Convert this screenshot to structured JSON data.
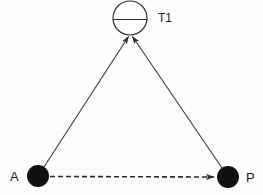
{
  "diagram": {
    "canvas": {
      "width": 263,
      "height": 195
    },
    "background_color": "#fdfdfd",
    "line_color": "#3a3a3a",
    "node_color": "#101010",
    "nodes": [
      {
        "id": "T1",
        "label": "T1",
        "type": "instrument-station",
        "symbol": "circle-with-horizontal-line",
        "x": 130,
        "y": 18,
        "radius": 17,
        "label_x": 158,
        "label_y": 22
      },
      {
        "id": "A",
        "label": "A",
        "type": "point-station",
        "symbol": "filled-circle",
        "x": 38,
        "y": 176,
        "radius": 11,
        "label_x": 10,
        "label_y": 181
      },
      {
        "id": "P",
        "label": "P",
        "type": "point-station",
        "symbol": "filled-circle",
        "x": 228,
        "y": 177,
        "radius": 11,
        "label_x": 246,
        "label_y": 182
      }
    ],
    "edges": [
      {
        "id": "A-to-T1",
        "from": "A",
        "to": "T1",
        "style": "solid",
        "arrow": "end",
        "x1": 44,
        "y1": 167,
        "x2": 128,
        "y2": 36
      },
      {
        "id": "P-to-T1",
        "from": "P",
        "to": "T1",
        "style": "solid",
        "arrow": "end",
        "x1": 222,
        "y1": 168,
        "x2": 133,
        "y2": 36
      },
      {
        "id": "A-to-P",
        "from": "A",
        "to": "P",
        "style": "dashed",
        "arrow": "end",
        "x1": 50,
        "y1": 176,
        "x2": 217,
        "y2": 177
      }
    ]
  }
}
